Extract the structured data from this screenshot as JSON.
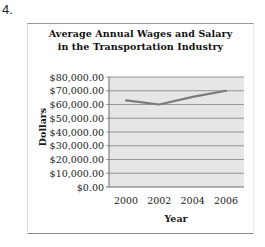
{
  "question": {
    "number": "4."
  },
  "colors": {
    "plot_background": "#e6e6e6",
    "gridline": "#8c8c8c",
    "series_line": "#7a7a7a",
    "axis": "#6a6a6a"
  },
  "chart_data": {
    "type": "line",
    "title": "Average Annual Wages and Salary in the Transportation Industry",
    "title_lines": [
      "Average Annual Wages and Salary",
      "in the Transportation Industry"
    ],
    "xlabel": "Year",
    "ylabel": "Dollars",
    "categories": [
      "2000",
      "2002",
      "2004",
      "2006"
    ],
    "series": [
      {
        "name": "Average Annual Wages and Salary",
        "values": [
          63000,
          60000,
          65500,
          70000
        ]
      }
    ],
    "ylim": [
      0,
      80000
    ],
    "yticks": [
      0,
      10000,
      20000,
      30000,
      40000,
      50000,
      60000,
      70000,
      80000
    ],
    "ytick_labels": [
      "$0.00",
      "$10,000.00",
      "$20,000.00",
      "$30,000.00",
      "$40,000.00",
      "$50,000.00",
      "$60,000.00",
      "$70,000.00",
      "$80,000.00"
    ],
    "grid": true,
    "legend": "none"
  }
}
